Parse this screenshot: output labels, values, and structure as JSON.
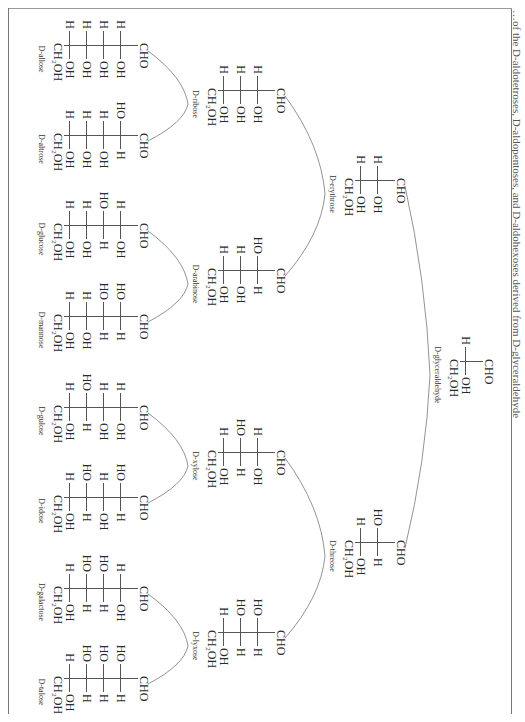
{
  "caption": "…of the D-aldotetroses, D-aldopentoses, and D-aldohexoses derived from D-glyceraldehyde",
  "molecules": [
    {
      "id": "glyceraldehyde",
      "name": "D-glyceraldehyde",
      "top": "CHO",
      "rows": [
        [
          "H",
          "OH"
        ]
      ],
      "bottom": "CH₂OH",
      "x": 361,
      "y": 30
    },
    {
      "id": "erythrose",
      "name": "D-erythrose",
      "top": "CHO",
      "rows": [
        [
          "H",
          "OH"
        ],
        [
          "H",
          "OH"
        ]
      ],
      "bottom": "CH₂OH",
      "x": 180,
      "y": 118
    },
    {
      "id": "threose",
      "name": "D-threose",
      "top": "CHO",
      "rows": [
        [
          "HO",
          "H"
        ],
        [
          "H",
          "OH"
        ]
      ],
      "bottom": "CH₂OH",
      "x": 542,
      "y": 118
    },
    {
      "id": "ribose",
      "name": "D-ribose",
      "top": "CHO",
      "rows": [
        [
          "H",
          "OH"
        ],
        [
          "H",
          "OH"
        ],
        [
          "H",
          "OH"
        ]
      ],
      "bottom": "CH₂OH",
      "x": 90,
      "y": 238
    },
    {
      "id": "arabinose",
      "name": "D-arabinose",
      "top": "CHO",
      "rows": [
        [
          "HO",
          "H"
        ],
        [
          "H",
          "OH"
        ],
        [
          "H",
          "OH"
        ]
      ],
      "bottom": "CH₂OH",
      "x": 270,
      "y": 238
    },
    {
      "id": "xylose",
      "name": "D-xylose",
      "top": "CHO",
      "rows": [
        [
          "H",
          "OH"
        ],
        [
          "HO",
          "H"
        ],
        [
          "H",
          "OH"
        ]
      ],
      "bottom": "CH₂OH",
      "x": 452,
      "y": 238
    },
    {
      "id": "lyxose",
      "name": "D-lyxose",
      "top": "CHO",
      "rows": [
        [
          "HO",
          "H"
        ],
        [
          "HO",
          "H"
        ],
        [
          "H",
          "OH"
        ]
      ],
      "bottom": "CH₂OH",
      "x": 632,
      "y": 238
    },
    {
      "id": "allose",
      "name": "D-allose",
      "top": "CHO",
      "rows": [
        [
          "H",
          "OH"
        ],
        [
          "H",
          "OH"
        ],
        [
          "H",
          "OH"
        ],
        [
          "H",
          "OH"
        ]
      ],
      "bottom": "CH₂OH",
      "x": 45,
      "y": 375
    },
    {
      "id": "altrose",
      "name": "D-altrose",
      "top": "CHO",
      "rows": [
        [
          "HO",
          "H"
        ],
        [
          "H",
          "OH"
        ],
        [
          "H",
          "OH"
        ],
        [
          "H",
          "OH"
        ]
      ],
      "bottom": "CH₂OH",
      "x": 135,
      "y": 375
    },
    {
      "id": "glucose",
      "name": "D-glucose",
      "top": "CHO",
      "rows": [
        [
          "H",
          "OH"
        ],
        [
          "HO",
          "H"
        ],
        [
          "H",
          "OH"
        ],
        [
          "H",
          "OH"
        ]
      ],
      "bottom": "CH₂OH",
      "x": 225,
      "y": 375
    },
    {
      "id": "mannose",
      "name": "D-mannose",
      "top": "CHO",
      "rows": [
        [
          "HO",
          "H"
        ],
        [
          "HO",
          "H"
        ],
        [
          "H",
          "OH"
        ],
        [
          "H",
          "OH"
        ]
      ],
      "bottom": "CH₂OH",
      "x": 316,
      "y": 375
    },
    {
      "id": "gulose",
      "name": "D-gulose",
      "top": "CHO",
      "rows": [
        [
          "H",
          "OH"
        ],
        [
          "H",
          "OH"
        ],
        [
          "HO",
          "H"
        ],
        [
          "H",
          "OH"
        ]
      ],
      "bottom": "CH₂OH",
      "x": 407,
      "y": 375
    },
    {
      "id": "idose",
      "name": "D-idose",
      "top": "CHO",
      "rows": [
        [
          "HO",
          "H"
        ],
        [
          "H",
          "OH"
        ],
        [
          "HO",
          "H"
        ],
        [
          "H",
          "OH"
        ]
      ],
      "bottom": "CH₂OH",
      "x": 497,
      "y": 375
    },
    {
      "id": "galactose",
      "name": "D-galactose",
      "top": "CHO",
      "rows": [
        [
          "H",
          "OH"
        ],
        [
          "HO",
          "H"
        ],
        [
          "HO",
          "H"
        ],
        [
          "H",
          "OH"
        ]
      ],
      "bottom": "CH₂OH",
      "x": 588,
      "y": 375
    },
    {
      "id": "talose",
      "name": "D-talose",
      "top": "CHO",
      "rows": [
        [
          "HO",
          "H"
        ],
        [
          "HO",
          "H"
        ],
        [
          "HO",
          "H"
        ],
        [
          "H",
          "OH"
        ]
      ],
      "bottom": "CH₂OH",
      "x": 678,
      "y": 375
    }
  ],
  "links": [
    [
      "glyceraldehyde",
      "erythrose"
    ],
    [
      "glyceraldehyde",
      "threose"
    ],
    [
      "erythrose",
      "ribose"
    ],
    [
      "erythrose",
      "arabinose"
    ],
    [
      "threose",
      "xylose"
    ],
    [
      "threose",
      "lyxose"
    ],
    [
      "ribose",
      "allose"
    ],
    [
      "ribose",
      "altrose"
    ],
    [
      "arabinose",
      "glucose"
    ],
    [
      "arabinose",
      "mannose"
    ],
    [
      "xylose",
      "gulose"
    ],
    [
      "xylose",
      "idose"
    ],
    [
      "lyxose",
      "galactose"
    ],
    [
      "lyxose",
      "talose"
    ]
  ]
}
